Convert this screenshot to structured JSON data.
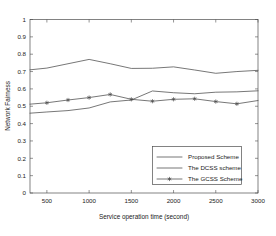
{
  "chart_data": {
    "type": "line",
    "title": "",
    "xlabel": "Service operation time (second)",
    "ylabel": "Network Fairness",
    "xlim": [
      300,
      3000
    ],
    "ylim": [
      0,
      1
    ],
    "grid": false,
    "legend_position": "lower-right",
    "xticks": [
      500,
      1000,
      1500,
      2000,
      2500,
      3000
    ],
    "xtick_labels": [
      "500",
      "1000",
      "1500",
      "2000",
      "2500",
      "3000"
    ],
    "yticks": [
      0,
      0.1,
      0.2,
      0.3,
      0.4,
      0.5,
      0.6,
      0.7,
      0.8,
      0.9,
      1
    ],
    "ytick_labels": [
      "0",
      "0.1",
      "0.2",
      "0.3",
      "0.4",
      "0.5",
      "0.6",
      "0.7",
      "0.8",
      "0.9",
      "1"
    ],
    "x": [
      300,
      500,
      750,
      1000,
      1250,
      1500,
      1750,
      2000,
      2250,
      2500,
      2750,
      3000
    ],
    "series": [
      {
        "name": "Proposed Scheme",
        "marker": "none",
        "values": [
          0.71,
          0.72,
          0.745,
          0.77,
          0.745,
          0.718,
          0.719,
          0.727,
          0.709,
          0.69,
          0.7,
          0.707
        ]
      },
      {
        "name": "The DCSS scheme",
        "marker": "none",
        "values": [
          0.46,
          0.467,
          0.475,
          0.49,
          0.525,
          0.536,
          0.588,
          0.578,
          0.572,
          0.581,
          0.583,
          0.589
        ]
      },
      {
        "name": "The GCSS Scheme",
        "marker": "star",
        "values": [
          0.512,
          0.52,
          0.536,
          0.55,
          0.568,
          0.54,
          0.529,
          0.54,
          0.543,
          0.527,
          0.514,
          0.533
        ]
      }
    ]
  },
  "legend": {
    "entries": [
      {
        "label": "Proposed Scheme",
        "marker": "none"
      },
      {
        "label": "The DCSS scheme",
        "marker": "none"
      },
      {
        "label": "The GCSS Scheme",
        "marker": "star"
      }
    ]
  },
  "colors": {
    "line": "#4a4a4a",
    "frame": "#4d4d4d",
    "text": "#1a1a1a",
    "background": "#ffffff"
  }
}
